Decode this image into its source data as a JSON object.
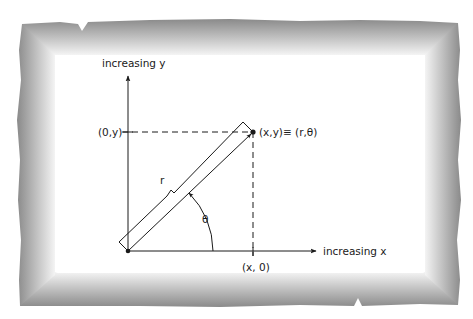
{
  "diagram": {
    "y_axis_label": "increasing y",
    "x_axis_label": "increasing x",
    "y_intercept_label": "(0,y)",
    "x_intercept_label": "(x, 0)",
    "point_label": "(x,y)≡ (r,θ)",
    "radius_label": "r",
    "angle_label": "θ"
  },
  "colors": {
    "ink": "#1a1a1a",
    "frame_dark": "#8c8c8c",
    "frame_light": "#e6e6e6",
    "background": "#ffffff"
  }
}
